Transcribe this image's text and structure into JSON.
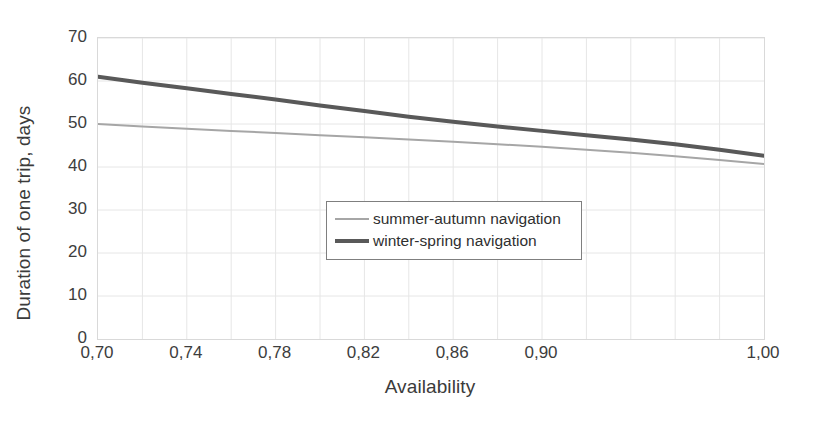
{
  "chart_data": {
    "type": "line",
    "title": "",
    "xlabel": "Availability",
    "ylabel": "Duration of one trip, days",
    "xlim": [
      0.7,
      1.0
    ],
    "ylim": [
      0,
      70
    ],
    "grid": true,
    "legend_position": "center",
    "x_tick_labels": [
      "0,70",
      "0,74",
      "0,78",
      "0,82",
      "0,86",
      "0,90",
      "1,00"
    ],
    "x_tick_values": [
      0.7,
      0.74,
      0.78,
      0.82,
      0.86,
      0.9,
      1.0
    ],
    "y_tick_labels": [
      "0",
      "10",
      "20",
      "30",
      "40",
      "50",
      "60",
      "70"
    ],
    "y_tick_values": [
      0,
      10,
      20,
      30,
      40,
      50,
      60,
      70
    ],
    "x": [
      0.7,
      0.72,
      0.74,
      0.76,
      0.78,
      0.8,
      0.82,
      0.84,
      0.86,
      0.88,
      0.9,
      0.92,
      0.94,
      0.96,
      0.98,
      1.0
    ],
    "series": [
      {
        "name": "summer-autumn navigation",
        "color": "#a6a6a6",
        "line_width": 2,
        "values": [
          50.0,
          49.4,
          48.9,
          48.4,
          47.9,
          47.4,
          46.9,
          46.4,
          45.9,
          45.3,
          44.7,
          44.0,
          43.3,
          42.5,
          41.6,
          40.7
        ]
      },
      {
        "name": "winter-spring navigation",
        "color": "#595959",
        "line_width": 4,
        "values": [
          61.0,
          59.6,
          58.3,
          57.0,
          55.7,
          54.3,
          53.0,
          51.7,
          50.5,
          49.4,
          48.4,
          47.4,
          46.4,
          45.3,
          44.0,
          42.6
        ]
      }
    ]
  },
  "legend": {
    "entries": [
      {
        "label": "summer-autumn navigation"
      },
      {
        "label": "winter-spring navigation"
      }
    ]
  }
}
